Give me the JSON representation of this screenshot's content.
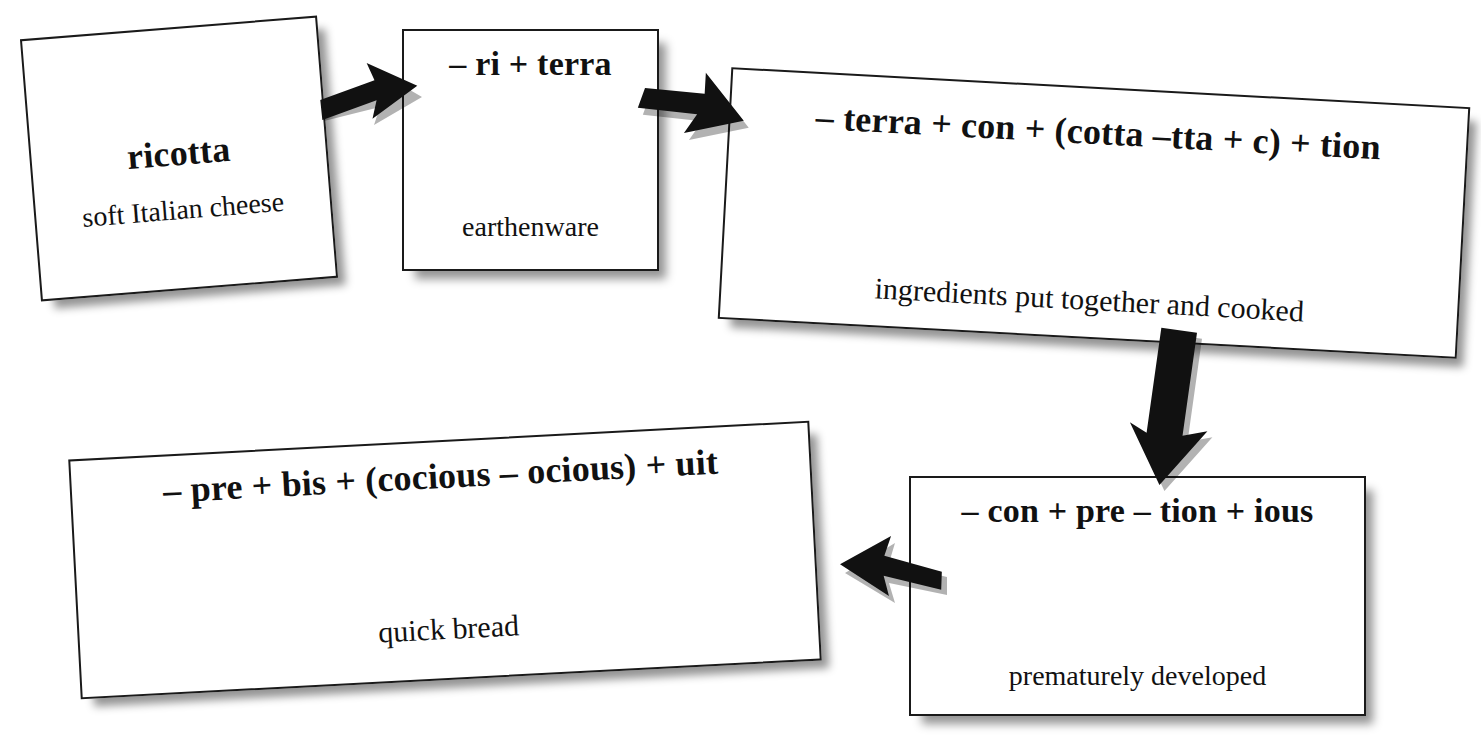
{
  "diagram": {
    "background_color": "#ffffff",
    "box_border_color": "#1a1a1a",
    "text_color": "#111111",
    "nodes": [
      {
        "id": "ricotta",
        "formula": "ricotta",
        "gloss": "soft Italian cheese"
      },
      {
        "id": "terracotta",
        "formula": "– ri + terra",
        "gloss": "earthenware"
      },
      {
        "id": "concoction",
        "formula": "– terra + con + (cotta –tta + c) + tion",
        "gloss": "ingredients put together and cooked"
      },
      {
        "id": "precocious",
        "formula": "– con + pre – tion + ious",
        "gloss": "prematurely developed"
      },
      {
        "id": "biscuit",
        "formula": "– pre + bis + (cocious – ocious) + uit",
        "gloss": "quick bread"
      }
    ],
    "arrows": [
      {
        "id": "arrow-1",
        "from": "ricotta",
        "to": "terracotta",
        "direction": "right"
      },
      {
        "id": "arrow-2",
        "from": "terracotta",
        "to": "concoction",
        "direction": "right-down"
      },
      {
        "id": "arrow-3",
        "from": "concoction",
        "to": "precocious",
        "direction": "down"
      },
      {
        "id": "arrow-4",
        "from": "precocious",
        "to": "biscuit",
        "direction": "left"
      }
    ]
  }
}
